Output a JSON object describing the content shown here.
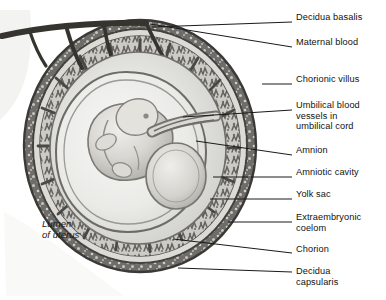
{
  "figure": {
    "type": "medical-illustration",
    "style": "grayscale pencil/airbrush anatomical drawing",
    "background_color": "#ffffff",
    "ink_color": "#111111",
    "leader_line_color": "#1a1a1a",
    "leader_line_end_x": 292,
    "label_text_x": 296
  },
  "labels": [
    {
      "id": "decidua-basalis",
      "text": "Decidua basalis",
      "x": 296,
      "y": 18,
      "leader_from": [
        152,
        27
      ],
      "leader_to": [
        292,
        22
      ]
    },
    {
      "id": "maternal-blood",
      "text": "Maternal blood",
      "x": 296,
      "y": 43,
      "leader_from": [
        150,
        24
      ],
      "leader_to": [
        292,
        47
      ]
    },
    {
      "id": "chorionic-villus",
      "text": "Chorionic villus",
      "x": 296,
      "y": 80,
      "leader_from": [
        262,
        84
      ],
      "leader_to": [
        292,
        84
      ]
    },
    {
      "id": "umbilical-vessels",
      "text": "Umbilical blood\nvessels in\numbilical cord",
      "x": 296,
      "y": 106,
      "leader_from": [
        183,
        117
      ],
      "leader_to": [
        292,
        110
      ]
    },
    {
      "id": "amnion",
      "text": "Amnion",
      "x": 296,
      "y": 151,
      "leader_from": [
        196,
        141
      ],
      "leader_to": [
        292,
        155
      ]
    },
    {
      "id": "amniotic-cavity",
      "text": "Amniotic cavity",
      "x": 296,
      "y": 173,
      "leader_from": [
        213,
        177
      ],
      "leader_to": [
        292,
        177
      ]
    },
    {
      "id": "yolk-sac",
      "text": "Yolk sac",
      "x": 296,
      "y": 195,
      "leader_from": [
        210,
        199
      ],
      "leader_to": [
        292,
        199
      ]
    },
    {
      "id": "extraembryonic-coelom",
      "text": "Extraembryonic\ncoelom",
      "x": 296,
      "y": 218,
      "leader_from": [
        228,
        222
      ],
      "leader_to": [
        292,
        222
      ]
    },
    {
      "id": "chorion",
      "text": "Chorion",
      "x": 296,
      "y": 250,
      "leader_from": [
        173,
        239
      ],
      "leader_to": [
        292,
        253
      ]
    },
    {
      "id": "decidua-capsularis",
      "text": "Decidua\ncapsularis",
      "x": 296,
      "y": 272,
      "leader_from": [
        178,
        268
      ],
      "leader_to": [
        292,
        272
      ]
    }
  ],
  "annotations": [
    {
      "id": "lumen-of-uterus",
      "text": "Lumen\nof uterus",
      "x": 42,
      "y": 218,
      "italic": true
    }
  ],
  "structures": {
    "decidua_capsularis_ring": "outer dark speckled band enclosing the conceptus",
    "chorion_ring": "pale band just inside the decidua capsularis",
    "chorionic_villi": "dense branched tufts filling the upper and outer ring",
    "maternal_vessel": "dark branching vessel crossing the upper-left decidua",
    "extraembryonic_coelom": "large pale crescent between chorion and amnion",
    "amnion": "thin membrane line bounding the amniotic cavity",
    "amniotic_cavity": "pale chamber surrounding the embryo",
    "embryo": "C-shaped curled embryo at center with head upper-left",
    "yolk_sac": "rounded sac to the right of the embryo",
    "umbilical_cord": "tube leaving the embryo toward the upper-right villi"
  }
}
